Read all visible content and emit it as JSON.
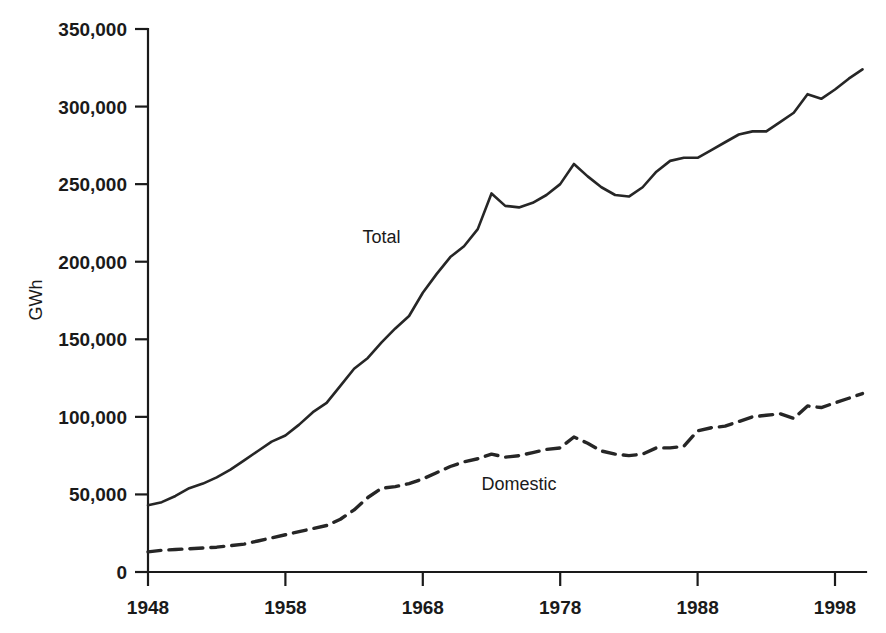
{
  "chart_data": {
    "type": "line",
    "title": "",
    "subtitle": "",
    "xlabel": "",
    "ylabel": "GWh",
    "xlim": [
      1948,
      2000
    ],
    "ylim": [
      0,
      350000
    ],
    "grid": false,
    "legend_position": "inline-annotations",
    "x_tick_labels": [
      "1948",
      "1958",
      "1968",
      "1978",
      "1988",
      "1998"
    ],
    "x_ticks": [
      1948,
      1958,
      1968,
      1978,
      1988,
      1998
    ],
    "y_tick_labels": [
      "0",
      "50,000",
      "100,000",
      "150,000",
      "200,000",
      "250,000",
      "300,000",
      "350,000"
    ],
    "y_ticks": [
      0,
      50000,
      100000,
      150000,
      200000,
      250000,
      300000,
      350000
    ],
    "annotations": [
      {
        "text": "Total",
        "x": 1965,
        "y": 212000
      },
      {
        "text": "Domestic",
        "x": 1975,
        "y": 53000
      }
    ],
    "x": [
      1948,
      1949,
      1950,
      1951,
      1952,
      1953,
      1954,
      1955,
      1956,
      1957,
      1958,
      1959,
      1960,
      1961,
      1962,
      1963,
      1964,
      1965,
      1966,
      1967,
      1968,
      1969,
      1970,
      1971,
      1972,
      1973,
      1974,
      1975,
      1976,
      1977,
      1978,
      1979,
      1980,
      1981,
      1982,
      1983,
      1984,
      1985,
      1986,
      1987,
      1988,
      1989,
      1990,
      1991,
      1992,
      1993,
      1994,
      1995,
      1996,
      1997,
      1998,
      1999,
      2000
    ],
    "series": [
      {
        "name": "Total",
        "style": "solid",
        "values": [
          43000,
          45000,
          49000,
          54000,
          57000,
          61000,
          66000,
          72000,
          78000,
          84000,
          88000,
          95000,
          103000,
          109000,
          120000,
          131000,
          138000,
          148000,
          157000,
          165000,
          180000,
          192000,
          203000,
          210000,
          221000,
          244000,
          236000,
          235000,
          238000,
          243000,
          250000,
          263000,
          255000,
          248000,
          243000,
          242000,
          248000,
          258000,
          265000,
          267000,
          267000,
          272000,
          277000,
          282000,
          284000,
          284000,
          290000,
          296000,
          308000,
          305000,
          311000,
          318000,
          324000
        ]
      },
      {
        "name": "Domestic",
        "style": "dashed",
        "values": [
          13000,
          14000,
          14500,
          15000,
          15500,
          16000,
          17000,
          18000,
          20000,
          22000,
          24000,
          26000,
          28000,
          30000,
          34000,
          40000,
          48000,
          54000,
          55000,
          57000,
          60000,
          64000,
          68000,
          71000,
          73000,
          76000,
          74000,
          75000,
          77000,
          79000,
          80000,
          87000,
          83000,
          78000,
          76000,
          75000,
          76000,
          80000,
          80000,
          81000,
          91000,
          93000,
          94000,
          97000,
          100000,
          101000,
          102000,
          99000,
          107000,
          106000,
          109000,
          112000,
          115000
        ]
      }
    ]
  }
}
